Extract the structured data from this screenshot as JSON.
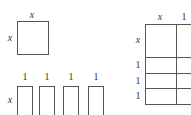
{
  "square": {
    "top_label": "x",
    "side_label": "x"
  },
  "strips": {
    "side_label": "x",
    "top_labels": [
      "1",
      "1",
      "1",
      "1"
    ]
  },
  "grid": {
    "column_labels": [
      "x",
      "1"
    ],
    "row_labels": [
      "x",
      "1",
      "1",
      "1"
    ]
  },
  "colors": {
    "line": "#555555",
    "text": "#333333",
    "background": "#ffffff"
  }
}
